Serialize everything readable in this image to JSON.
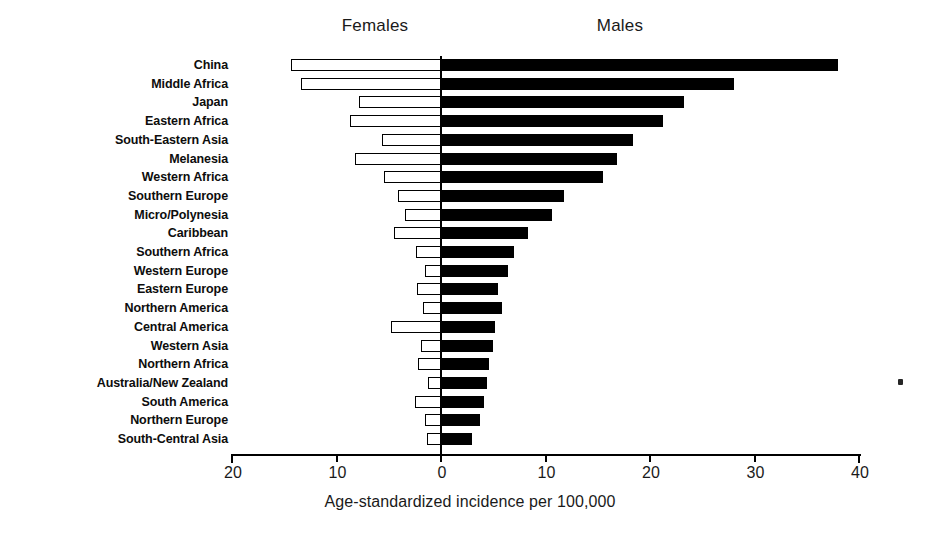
{
  "figure": {
    "panel_left_header": "Females",
    "panel_right_header": "Males",
    "axis_title": "Age-standardized incidence per 100,000",
    "axis_tick_labels": [
      "20",
      "10",
      "0",
      "10",
      "20",
      "30",
      "40"
    ],
    "bar_colors": {
      "female": "#ffffff",
      "female_outline": "#000000",
      "male": "#000000"
    }
  },
  "chart_data": {
    "type": "bar",
    "orientation": "horizontal",
    "subtype": "population-pyramid / back-to-back bar",
    "title": "",
    "xlabel": "Age-standardized incidence per 100,000",
    "ylabel": "",
    "xlim": [
      -20,
      40
    ],
    "xticks": [
      -20,
      -10,
      0,
      10,
      20,
      30,
      40
    ],
    "xticklabels": [
      "20",
      "10",
      "0",
      "10",
      "20",
      "30",
      "40"
    ],
    "grid": false,
    "legend": [
      "Females",
      "Males"
    ],
    "legend_position": "top (panel headers)",
    "categories": [
      "China",
      "Middle Africa",
      "Japan",
      "Eastern Africa",
      "South-Eastern Asia",
      "Melanesia",
      "Western Africa",
      "Southern Europe",
      "Micro/Polynesia",
      "Caribbean",
      "Southern Africa",
      "Western Europe",
      "Eastern Europe",
      "Northern America",
      "Central America",
      "Western Asia",
      "Northern Africa",
      "Australia/New Zealand",
      "South America",
      "Northern Europe",
      "South-Central Asia"
    ],
    "series": [
      {
        "name": "Females",
        "direction": "left",
        "values": [
          14.4,
          13.4,
          7.8,
          8.7,
          5.6,
          8.2,
          5.5,
          4.1,
          3.4,
          4.5,
          2.4,
          1.5,
          2.3,
          1.7,
          4.8,
          1.9,
          2.2,
          1.2,
          2.5,
          1.5,
          1.3
        ]
      },
      {
        "name": "Males",
        "direction": "right",
        "values": [
          38.0,
          28.0,
          23.3,
          21.2,
          18.4,
          16.8,
          15.5,
          11.8,
          10.6,
          8.3,
          7.0,
          6.4,
          5.5,
          5.8,
          5.2,
          5.0,
          4.6,
          4.4,
          4.1,
          3.7,
          3.0
        ]
      }
    ]
  }
}
